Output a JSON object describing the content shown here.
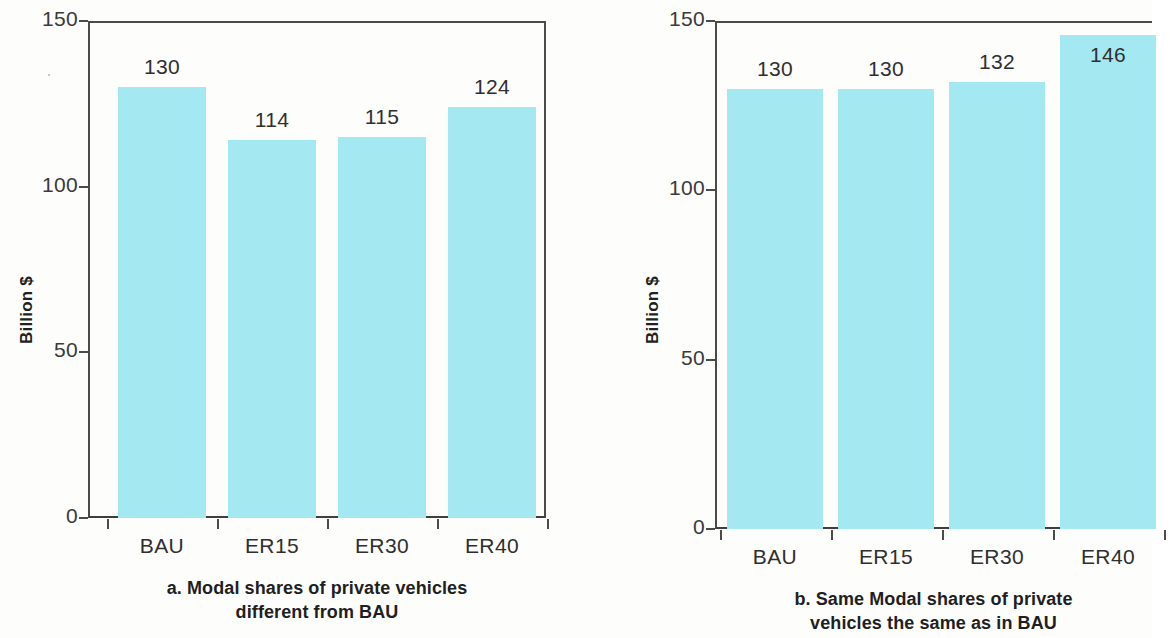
{
  "figure": {
    "background_color": "#fdfdfc",
    "bar_color": "#a4e9f1",
    "axis_color": "#4b4b4b",
    "text_color": "#231f20"
  },
  "chart_data": [
    {
      "type": "bar",
      "panel_id": "a",
      "title": "",
      "caption_line1": "a. Modal shares of private vehicles",
      "caption_line2": "different from BAU",
      "categories": [
        "BAU",
        "ER15",
        "ER30",
        "ER40"
      ],
      "values": [
        130,
        114,
        115,
        124
      ],
      "value_labels": [
        "130",
        "114",
        "115",
        "124"
      ],
      "label_placement": [
        "above",
        "above",
        "above",
        "above"
      ],
      "xlabel": "",
      "ylabel": "Billion $",
      "ylim": [
        0,
        150
      ],
      "yticks": [
        0,
        50,
        100,
        150
      ],
      "ytick_labels": [
        "0",
        "50",
        "100",
        "150"
      ],
      "grid": false,
      "legend": false
    },
    {
      "type": "bar",
      "panel_id": "b",
      "title": "",
      "caption_line1": "b. Same Modal shares of private",
      "caption_line2": "vehicles the same as in BAU",
      "categories": [
        "BAU",
        "ER15",
        "ER30",
        "ER40"
      ],
      "values": [
        130,
        130,
        132,
        146
      ],
      "value_labels": [
        "130",
        "130",
        "132",
        "146"
      ],
      "label_placement": [
        "above",
        "above",
        "above",
        "inside"
      ],
      "xlabel": "",
      "ylabel": "Billion $",
      "ylim": [
        0,
        150
      ],
      "yticks": [
        0,
        50,
        100,
        150
      ],
      "ytick_labels": [
        "0",
        "50",
        "100",
        "150"
      ],
      "grid": false,
      "legend": false
    }
  ]
}
